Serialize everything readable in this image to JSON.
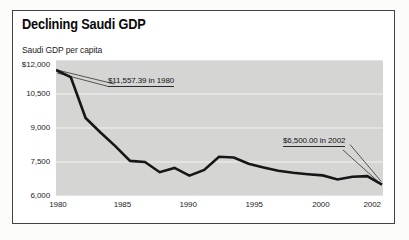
{
  "title": "Declining Saudi GDP",
  "subtitle": "Saudi GDP per capita",
  "colors": {
    "plot_background": "#d5d5d4",
    "gridline": "#f2f2f0",
    "data_line": "#161616",
    "frame_border": "#424242",
    "text": "#141414"
  },
  "chart_data": {
    "type": "line",
    "title": "Declining Saudi GDP",
    "ylabel": "Saudi GDP per capita",
    "x": [
      1980,
      1981,
      1982,
      1983,
      1984,
      1985,
      1986,
      1987,
      1988,
      1989,
      1990,
      1991,
      1992,
      1993,
      1994,
      1995,
      1996,
      1997,
      1998,
      1999,
      2000,
      2001,
      2002
    ],
    "values": [
      11557.39,
      11240,
      9440,
      8800,
      8200,
      7550,
      7500,
      7050,
      7240,
      6900,
      7150,
      7730,
      7700,
      7420,
      7260,
      7110,
      7030,
      6960,
      6910,
      6730,
      6850,
      6880,
      6500
    ],
    "xlim": [
      1980,
      2002
    ],
    "ylim": [
      6000,
      12000
    ],
    "x_ticks": [
      {
        "label": "1980",
        "value": 1980
      },
      {
        "label": "1985",
        "value": 1985
      },
      {
        "label": "1990",
        "value": 1990
      },
      {
        "label": "1995",
        "value": 1995
      },
      {
        "label": "2000",
        "value": 2000
      },
      {
        "label": "2002",
        "value": 2002
      }
    ],
    "y_ticks": [
      {
        "label": "$12,000",
        "value": 12000
      },
      {
        "label": "10,500",
        "value": 10500
      },
      {
        "label": "9,000",
        "value": 9000
      },
      {
        "label": "7,500",
        "value": 7500
      },
      {
        "label": "6,000",
        "value": 6000
      }
    ],
    "grid": "horizontal",
    "legend": "none",
    "annotations": [
      {
        "text": "$11,557.39 in 1980",
        "year": 1980,
        "value": 11557.39
      },
      {
        "text": "$6,500.00 in 2002",
        "year": 2002,
        "value": 6500.0
      }
    ]
  }
}
